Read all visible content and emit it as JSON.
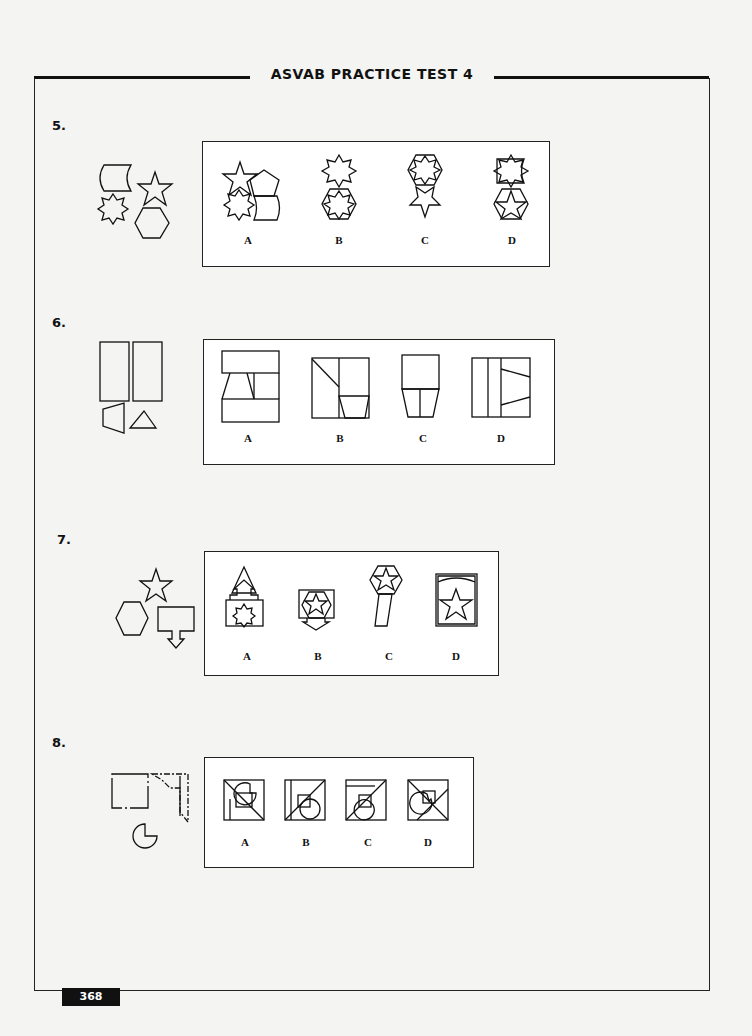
{
  "header": {
    "title": "ASVAB PRACTICE TEST 4"
  },
  "page_number": "368",
  "questions": [
    {
      "number": "5.",
      "given_shapes": [
        "curved-square",
        "five-point-star",
        "eight-point-star",
        "hexagon"
      ],
      "options": [
        {
          "label": "A",
          "description": "star, pentagon, eight-point star and curved square assembled together"
        },
        {
          "label": "B",
          "description": "eight-point star above hexagon containing eight-point star"
        },
        {
          "label": "C",
          "description": "hexagon with eight-point star above five-point star"
        },
        {
          "label": "D",
          "description": "curved square over eight-point star above hexagon containing star"
        }
      ]
    },
    {
      "number": "6.",
      "given_shapes": [
        "tall-rectangle",
        "tall-rectangle",
        "trapezoid",
        "triangle"
      ],
      "options": [
        {
          "label": "A",
          "description": "square divided into two rectangles with trapezoid and triangle in middle band"
        },
        {
          "label": "B",
          "description": "square with diagonal line, vertical divider and trapezoid at bottom-right"
        },
        {
          "label": "C",
          "description": "rectangle above trapezoid split vertically"
        },
        {
          "label": "D",
          "description": "square with two vertical strips and trapezoid section on right"
        }
      ]
    },
    {
      "number": "7.",
      "given_shapes": [
        "five-point-star",
        "hexagon",
        "square-with-arrow"
      ],
      "options": [
        {
          "label": "A",
          "description": "triangle with up-arrow above rectangle containing eight-point star"
        },
        {
          "label": "B",
          "description": "rectangle with star in hexagon and down-arrow"
        },
        {
          "label": "C",
          "description": "hexagon with star on a slanted bar"
        },
        {
          "label": "D",
          "description": "curved square containing large star"
        }
      ]
    },
    {
      "number": "8.",
      "given_shapes": [
        "square",
        "corner-piece",
        "circle-with-notch"
      ],
      "options": [
        {
          "label": "A",
          "description": "square with notched circle top-right and vertical strip"
        },
        {
          "label": "B",
          "description": "square with diagonal, small square and full circle"
        },
        {
          "label": "C",
          "description": "square with top strip, diagonal and notched circle"
        },
        {
          "label": "D",
          "description": "square with diagonals and notched circle"
        }
      ]
    }
  ]
}
